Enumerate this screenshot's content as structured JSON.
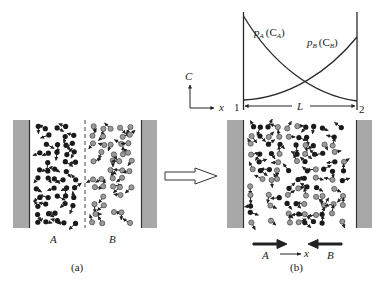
{
  "panel_a": {
    "caption": "(a)",
    "label_a": "A",
    "label_b": "B",
    "region_a_particles": "dark",
    "region_b_particles": "light",
    "divider": "dashed"
  },
  "panel_b": {
    "caption": "(b)",
    "flux_a_label": "A",
    "flux_b_label": "B",
    "flux_axis_label": "x",
    "particles": "mixed"
  },
  "transition_arrow": "hollow-right-arrow",
  "graph": {
    "y_axis_label": "C",
    "x_axis_label": "x",
    "boundary_left": "1",
    "boundary_right": "2",
    "length_label": "L",
    "curve_a_label": "p_A(C_A)",
    "curve_a_p": "p",
    "curve_a_sub": "A",
    "curve_a_c": "(C",
    "curve_a_csub": "A",
    "curve_a_close": ")",
    "curve_b_p": "p",
    "curve_b_sub": "B",
    "curve_b_c": "(C",
    "curve_b_csub": "B",
    "curve_b_close": ")",
    "curve_a_trend": "decreasing from 1 to 2",
    "curve_b_trend": "increasing from 1 to 2"
  },
  "colors": {
    "wall_fill": "#a8a8a8",
    "wall_edge": "#333333",
    "particle_dark": "#1a1a1a",
    "particle_light": "#9a9a9a",
    "line": "#2a2a2a"
  }
}
